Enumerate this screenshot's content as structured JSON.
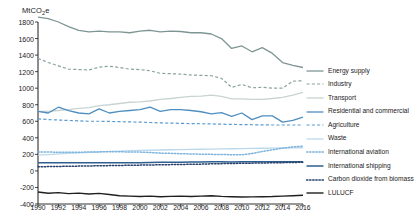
{
  "chart_data": {
    "type": "line",
    "title": "",
    "subtitle": "",
    "xlabel": "",
    "ylabel": "MtCO2e",
    "ylabel_rich": {
      "prefix": "MtCO",
      "sub": "2",
      "suffix": "e"
    },
    "grid": false,
    "legend_position": "right",
    "xlim": [
      1990,
      2016
    ],
    "ylim": [
      -400,
      1800
    ],
    "ytick_step": 200,
    "xtick_step": 2,
    "yticks": [
      -400,
      -200,
      0,
      200,
      400,
      600,
      800,
      1000,
      1200,
      1400,
      1600,
      1800
    ],
    "xticks": [
      1990,
      1992,
      1994,
      1996,
      1998,
      2000,
      2002,
      2004,
      2006,
      2008,
      2010,
      2012,
      2014,
      2016
    ],
    "x": [
      1990,
      1991,
      1992,
      1993,
      1994,
      1995,
      1996,
      1997,
      1998,
      1999,
      2000,
      2001,
      2002,
      2003,
      2004,
      2005,
      2006,
      2007,
      2008,
      2009,
      2010,
      2011,
      2012,
      2013,
      2014,
      2015,
      2016
    ],
    "series": [
      {
        "name": "Energy supply",
        "color": "#7e9693",
        "dash": "solid",
        "width": 1.3,
        "values": [
          1860,
          1840,
          1800,
          1745,
          1700,
          1680,
          1690,
          1680,
          1680,
          1670,
          1690,
          1700,
          1680,
          1690,
          1685,
          1670,
          1670,
          1655,
          1600,
          1480,
          1510,
          1440,
          1490,
          1420,
          1310,
          1275,
          1250
        ]
      },
      {
        "name": "Industry",
        "color": "#8aa3a0",
        "dash": "dashed",
        "width": 1.2,
        "values": [
          1360,
          1310,
          1270,
          1230,
          1225,
          1220,
          1255,
          1265,
          1250,
          1230,
          1225,
          1210,
          1180,
          1175,
          1170,
          1160,
          1155,
          1150,
          1120,
          1010,
          1045,
          1005,
          1010,
          1000,
          1000,
          1085,
          1090
        ]
      },
      {
        "name": "Transport",
        "color": "#c8d4d2",
        "dash": "solid",
        "width": 1.3,
        "values": [
          720,
          720,
          730,
          740,
          755,
          765,
          790,
          800,
          815,
          830,
          835,
          845,
          865,
          875,
          890,
          900,
          905,
          915,
          900,
          870,
          870,
          865,
          865,
          875,
          890,
          915,
          950
        ]
      },
      {
        "name": "Residential and commercial",
        "color": "#4f8ec0",
        "dash": "solid",
        "width": 1.3,
        "values": [
          720,
          700,
          770,
          730,
          700,
          690,
          750,
          700,
          720,
          730,
          740,
          770,
          720,
          740,
          740,
          730,
          715,
          690,
          705,
          660,
          700,
          620,
          665,
          665,
          590,
          610,
          650
        ]
      },
      {
        "name": "Agriculture",
        "color": "#5b9bd1",
        "dash": "dashed",
        "width": 1.2,
        "values": [
          630,
          620,
          615,
          610,
          605,
          600,
          600,
          598,
          595,
          592,
          590,
          585,
          580,
          578,
          575,
          572,
          570,
          568,
          565,
          562,
          560,
          558,
          556,
          555,
          555,
          555,
          555
        ]
      },
      {
        "name": "Waste",
        "color": "#bcd8ec",
        "dash": "solid",
        "width": 1.3,
        "values": [
          190,
          197,
          205,
          212,
          218,
          224,
          230,
          236,
          240,
          244,
          248,
          250,
          253,
          256,
          258,
          260,
          262,
          264,
          266,
          268,
          270,
          272,
          274,
          276,
          277,
          279,
          280
        ]
      },
      {
        "name": "International aviation",
        "color": "#7db4de",
        "dash": "dotted",
        "width": 1.5,
        "values": [
          230,
          228,
          226,
          224,
          226,
          228,
          230,
          232,
          232,
          228,
          228,
          222,
          215,
          212,
          208,
          205,
          202,
          200,
          198,
          196,
          195,
          210,
          235,
          255,
          275,
          290,
          300
        ]
      },
      {
        "name": "International shipping",
        "color": "#2f5f90",
        "dash": "solid",
        "width": 1.5,
        "values": [
          100,
          100,
          100,
          100,
          100,
          100,
          100,
          100,
          100,
          100,
          100,
          102,
          104,
          106,
          106,
          108,
          108,
          110,
          110,
          108,
          112,
          112,
          112,
          112,
          110,
          110,
          110
        ]
      },
      {
        "name": "Carbon dioxide from biomass",
        "color": "#27416b",
        "dash": "dotted",
        "width": 1.5,
        "values": [
          50,
          52,
          54,
          56,
          58,
          60,
          62,
          64,
          66,
          68,
          70,
          72,
          74,
          76,
          78,
          80,
          82,
          86,
          88,
          90,
          92,
          94,
          96,
          98,
          100,
          102,
          105
        ]
      },
      {
        "name": "LULUCF",
        "color": "#1f1f1f",
        "dash": "solid",
        "width": 1.4,
        "values": [
          -255,
          -270,
          -262,
          -275,
          -268,
          -280,
          -272,
          -285,
          -300,
          -305,
          -310,
          -305,
          -312,
          -308,
          -305,
          -310,
          -305,
          -300,
          -308,
          -312,
          -315,
          -314,
          -312,
          -310,
          -305,
          -300,
          -295
        ]
      }
    ]
  },
  "legend": {
    "items": [
      {
        "label": "Energy supply"
      },
      {
        "label": "Industry"
      },
      {
        "label": "Transport"
      },
      {
        "label": "Residential and commercial"
      },
      {
        "label": "Agriculture"
      },
      {
        "label": "Waste"
      },
      {
        "label": "International aviation"
      },
      {
        "label": "International shipping"
      },
      {
        "label": "Carbon dioxide from biomass"
      },
      {
        "label": "LULUCF"
      }
    ]
  },
  "axis_style": {
    "axis_color": "#1a1a1a",
    "background": "#ffffff"
  }
}
